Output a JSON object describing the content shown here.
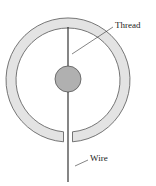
{
  "diagram": {
    "labels": {
      "thread": "Thread",
      "wire": "Wire"
    },
    "colors": {
      "ring_fill": "#e3e3e3",
      "ring_stroke": "#555555",
      "ball_fill": "#b0b0b0",
      "line": "#222222"
    }
  }
}
